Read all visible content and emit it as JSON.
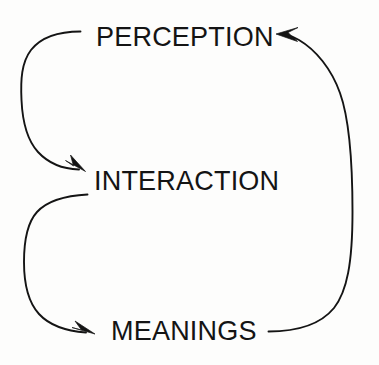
{
  "diagram": {
    "type": "cyclic-flow-diagram",
    "background_color": "#fdfdfc",
    "stroke_color": "#141414",
    "text_color": "#141414",
    "nodes": [
      {
        "id": "perception",
        "label": "PERCEPTION"
      },
      {
        "id": "interaction",
        "label": "INTERACTION"
      },
      {
        "id": "meanings",
        "label": "MEANINGS"
      }
    ],
    "edges": [
      {
        "id": "perception-to-interaction",
        "from": "PERCEPTION",
        "to": "INTERACTION",
        "side": "left",
        "arrowhead": "at-target"
      },
      {
        "id": "interaction-to-meanings",
        "from": "INTERACTION",
        "to": "MEANINGS",
        "side": "left",
        "arrowhead": "at-target"
      },
      {
        "id": "meanings-to-perception",
        "from": "MEANINGS",
        "to": "PERCEPTION",
        "side": "right",
        "arrowhead": "at-target"
      }
    ]
  }
}
